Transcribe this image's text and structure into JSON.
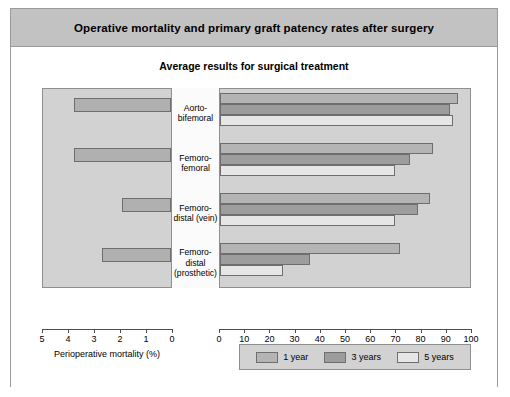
{
  "figure": {
    "title": "Operative mortality and primary graft patency rates after surgery",
    "subtitle": "Average results for surgical treatment"
  },
  "chart_data": {
    "type": "bar",
    "orientation": "horizontal",
    "title": "Operative mortality and primary graft patency rates after surgery",
    "subtitle": "Average results for surgical treatment",
    "categories": [
      "Aorto-bifemoral",
      "Femoro-femoral",
      "Femoro-distal (vein)",
      "Femoro-distal (prosthetic)"
    ],
    "category_lines": [
      [
        "Aorto-",
        "bifemoral"
      ],
      [
        "Femoro-",
        "femoral"
      ],
      [
        "Femoro-",
        "distal (vein)"
      ],
      [
        "Femoro-",
        "distal",
        "(prosthetic)"
      ]
    ],
    "panels": [
      {
        "name": "left",
        "xlabel": "Perioperative mortality (%)",
        "xlim": [
          5,
          0
        ],
        "reversed": true,
        "ticks": [
          5,
          4,
          3,
          2,
          1,
          0
        ],
        "tick_labels": [
          "5",
          "4",
          "3",
          "2",
          "1",
          "0"
        ],
        "series": [
          {
            "name": "Perioperative mortality",
            "values": [
              3.8,
              3.8,
              1.9,
              2.7
            ]
          }
        ]
      },
      {
        "name": "right",
        "xlabel": "Primary patency at 1, 3 and 5 years (%)",
        "xlim": [
          0,
          100
        ],
        "reversed": false,
        "ticks": [
          0,
          10,
          20,
          30,
          40,
          50,
          60,
          70,
          80,
          90,
          100
        ],
        "tick_labels": [
          "0",
          "10",
          "20",
          "30",
          "40",
          "50",
          "60",
          "70",
          "80",
          "90",
          "100"
        ],
        "series": [
          {
            "name": "1 year",
            "values": [
              95,
              85,
              84,
              72
            ]
          },
          {
            "name": "3 years",
            "values": [
              92,
              76,
              79,
              36
            ]
          },
          {
            "name": "5 years",
            "values": [
              93,
              70,
              70,
              25
            ]
          }
        ]
      }
    ],
    "legend": {
      "position": "bottom",
      "entries": [
        {
          "label": "1 year",
          "color": "#b4b4b4"
        },
        {
          "label": "3 years",
          "color": "#9d9d9d"
        },
        {
          "label": "5 years",
          "color": "#e6e6e6"
        }
      ]
    },
    "colors": {
      "panel_background": "#d2d2d2",
      "title_bar": "#c2c2c2",
      "bar_border": "#6e6e6e",
      "frame": "#9a9a9a"
    }
  }
}
